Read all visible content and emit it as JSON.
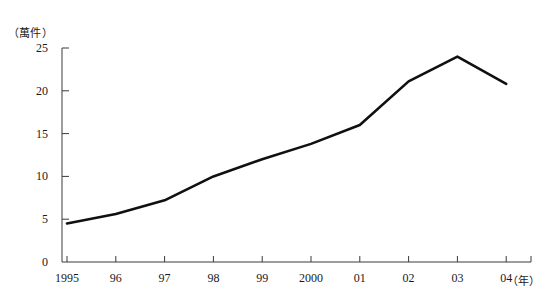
{
  "chart_data": {
    "type": "line",
    "title": "",
    "xlabel": "(年)",
    "ylabel": "(萬件)",
    "categories": [
      "1995",
      "96",
      "97",
      "98",
      "99",
      "2000",
      "01",
      "02",
      "03",
      "04"
    ],
    "values": [
      4.5,
      5.6,
      7.2,
      10.0,
      12.0,
      13.8,
      16.0,
      21.1,
      24.0,
      20.8
    ],
    "series": [
      {
        "name": "",
        "values": [
          4.5,
          5.6,
          7.2,
          10.0,
          12.0,
          13.8,
          16.0,
          21.1,
          24.0,
          20.8
        ]
      }
    ],
    "ylim": [
      0,
      25
    ],
    "yticks": [
      0,
      5,
      10,
      15,
      20,
      25
    ],
    "ytick_labels": [
      "0",
      "5",
      "10",
      "15",
      "20",
      "25"
    ],
    "grid": false,
    "legend": false,
    "line_color": "#101010",
    "axis_color": "#3a3a3a"
  },
  "axes": {
    "y_unit": "（萬件）",
    "x_unit": "（年）"
  }
}
